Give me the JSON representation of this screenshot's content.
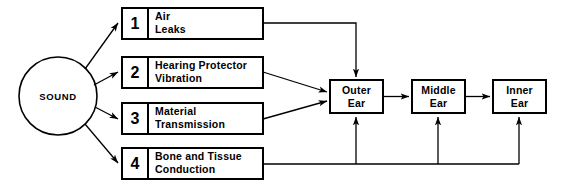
{
  "diagram": {
    "source_node": {
      "label": "SOUND",
      "shape": "circle"
    },
    "pathways": [
      {
        "number": "1",
        "line1": "Air",
        "line2": "Leaks",
        "target": "Outer Ear",
        "route": "top"
      },
      {
        "number": "2",
        "line1": "Hearing Protector",
        "line2": "Vibration",
        "target": "Outer Ear",
        "route": "left"
      },
      {
        "number": "3",
        "line1": "Material",
        "line2": "Transmission",
        "target": "Outer Ear",
        "route": "left"
      },
      {
        "number": "4",
        "line1": "Bone and Tissue",
        "line2": "Conduction",
        "target": "Outer Ear, Middle Ear, Inner Ear",
        "route": "bottom"
      }
    ],
    "ear_stages": [
      {
        "line1": "Outer",
        "line2": "Ear"
      },
      {
        "line1": "Middle",
        "line2": "Ear"
      },
      {
        "line1": "Inner",
        "line2": "Ear"
      }
    ],
    "colors": {
      "stroke": "#000000",
      "background": "#ffffff",
      "text": "#000000"
    }
  }
}
